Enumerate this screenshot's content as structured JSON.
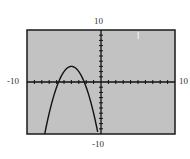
{
  "chart_data": {
    "type": "line",
    "title": "",
    "xlabel": "",
    "ylabel": "",
    "xlim": [
      -10,
      10
    ],
    "ylim": [
      -10,
      10
    ],
    "xscale": 1,
    "yscale": 1,
    "grid": false,
    "legend": null,
    "function": "y = -(x + 4)^2 + 3",
    "vertex": [
      -4,
      3
    ],
    "x_intercepts": [
      -5.73,
      -2.27
    ],
    "series": [
      {
        "name": "parabola",
        "x": [
          -7.6,
          -7,
          -6.5,
          -6,
          -5.5,
          -5,
          -4.5,
          -4,
          -3.5,
          -3,
          -2.5,
          -2,
          -1.5,
          -1,
          -0.4
        ],
        "y": [
          -9.96,
          -6,
          -3.25,
          -1,
          0.75,
          2,
          2.75,
          3,
          2.75,
          2,
          0.75,
          -1,
          -3.25,
          -6,
          -9.96
        ]
      }
    ],
    "tick_labels": {
      "x_min": "-10",
      "x_max": "10",
      "y_min": "-10",
      "y_max": "10"
    }
  },
  "colors": {
    "plot_background": "#c2c2c2",
    "frame": "#1a1a1a",
    "axes": "#111111",
    "curve": "#111111",
    "label_text": "#333333"
  }
}
